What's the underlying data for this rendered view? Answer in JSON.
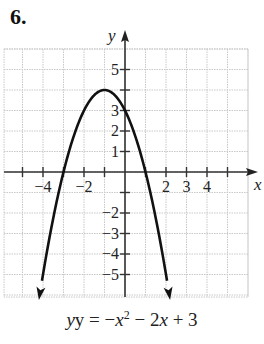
{
  "problem": {
    "number": "6."
  },
  "chart_data": {
    "type": "line",
    "title": "",
    "caption": "y = −x² − 2x + 3",
    "function": "y = -x^2 - 2x + 3",
    "xlabel": "x",
    "ylabel": "y",
    "xlim": [
      -6,
      6
    ],
    "ylim": [
      -6,
      6
    ],
    "grid": true,
    "x_tick_labels": [
      "-4",
      "-2",
      "2",
      "3",
      "4"
    ],
    "x_tick_positions": [
      -5,
      -4,
      -3,
      -2,
      -1,
      1,
      2,
      3,
      4,
      5
    ],
    "y_tick_labels": [
      "5",
      "3",
      "2",
      "1",
      "-2",
      "-3",
      "-4",
      "-5"
    ],
    "y_tick_positions": [
      -5,
      -4,
      -3,
      -2,
      -1,
      1,
      2,
      3,
      4,
      5
    ],
    "vertex": [
      -1,
      4
    ],
    "y_intercept": [
      0,
      3
    ],
    "x_intercepts": [
      -3,
      1
    ],
    "series": [
      {
        "name": "y = -x^2 - 2x + 3",
        "x": [
          -4.2,
          -4,
          -3.5,
          -3,
          -2.5,
          -2,
          -1.5,
          -1,
          -0.5,
          0,
          0.5,
          1,
          1.5,
          2,
          2.2
        ],
        "y": [
          -6.24,
          -5,
          -2.25,
          0,
          1.75,
          3,
          3.75,
          4,
          3.75,
          3,
          1.75,
          0,
          -2.25,
          -5,
          -6.24
        ]
      }
    ]
  },
  "labels": {
    "x_axis": "x",
    "y_axis": "y",
    "eq_prefix": "y = −",
    "eq_var": "x",
    "eq_exp": "2",
    "eq_mid": " − 2",
    "eq_var2": "x",
    "eq_suffix": " + 3"
  }
}
